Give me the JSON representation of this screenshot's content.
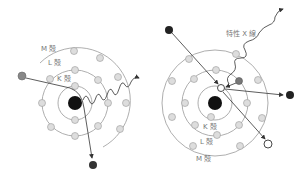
{
  "left": {
    "labels": {
      "m_shell": "M 殻",
      "l_shell": "L 殻",
      "k_shell": "K 殻"
    }
  },
  "right": {
    "labels": {
      "xray": "特性 X 線",
      "k_shell": "K 殻",
      "l_shell": "L 殻",
      "m_shell": "M 殻"
    }
  },
  "colors": {
    "shell_line": "#999999",
    "electron_fill": "#dddddd",
    "electron_stroke": "#999999",
    "nucleus": "#111111",
    "incident_gray": "#888888",
    "arrow": "#333333"
  }
}
